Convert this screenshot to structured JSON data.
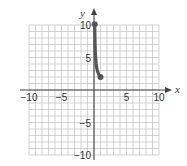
{
  "chart_data": {
    "type": "line",
    "title": "",
    "xlabel": "x",
    "ylabel": "y",
    "xlim": [
      -10,
      10
    ],
    "ylim": [
      -10,
      10
    ],
    "grid": true,
    "grid_step": 1,
    "x_tick_labels": [
      "−10",
      "−5",
      "5",
      "10"
    ],
    "x_tick_values": [
      -10,
      -5,
      5,
      10
    ],
    "y_tick_labels": [
      "10",
      "5",
      "−5",
      "−10"
    ],
    "y_tick_values": [
      10,
      5,
      -5,
      -10
    ],
    "series": [
      {
        "name": "curve",
        "color": "#555555",
        "endpoints": "closed dots",
        "x": [
          0.11,
          0.15,
          0.2,
          0.25,
          0.33,
          0.5,
          0.75,
          1.0
        ],
        "y": [
          10.1,
          7.7,
          6.0,
          5.0,
          4.0,
          3.0,
          2.33,
          2.0
        ]
      }
    ]
  }
}
